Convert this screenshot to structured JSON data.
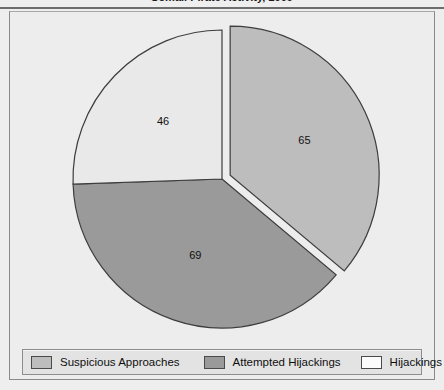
{
  "chart_data": {
    "type": "pie",
    "title": "Somali Pirate Activity, 2009",
    "title_cropped": true,
    "categories": [
      "Suspicious Approaches",
      "Attempted Hijackings",
      "Hijackings"
    ],
    "values": [
      65,
      69,
      46
    ],
    "total": 180,
    "labels": [
      "65",
      "69",
      "46"
    ],
    "start_angle_deg": 0,
    "direction": "clockwise",
    "exploded_slice_index": 0,
    "slice_angles_deg": [
      130,
      138,
      92
    ],
    "colors": [
      "#bdbdbd",
      "#9a9a9a",
      "#e9e9e9"
    ],
    "slice_stroke": "#3d3d3d",
    "legend_position": "bottom",
    "grid": false,
    "xlabel": "",
    "ylabel": ""
  },
  "legend": {
    "items": [
      {
        "label": "Suspicious Approaches",
        "color": "#bdbdbd"
      },
      {
        "label": "Attempted Hijackings",
        "color": "#9a9a9a"
      },
      {
        "label": "Hijackings",
        "color": "#fbfbfb"
      }
    ]
  },
  "theme": {
    "page_background": "#eeeeee",
    "plot_background": "#ededed",
    "frame_border": "#8a8a8a",
    "legend_background": "#e3e3e3",
    "text_color": "#101010"
  }
}
